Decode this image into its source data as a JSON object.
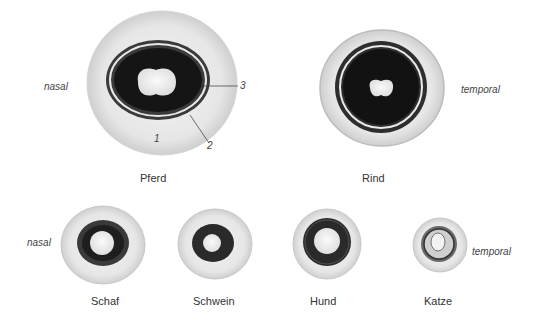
{
  "figure": {
    "orientation_labels": {
      "nasal_top": "nasal",
      "temporal_top": "temporal",
      "nasal_bottom": "nasal",
      "temporal_bottom": "temporal"
    },
    "specimens": [
      {
        "id": "pferd",
        "name": "Pferd"
      },
      {
        "id": "rind",
        "name": "Rind"
      },
      {
        "id": "schaf",
        "name": "Schaf"
      },
      {
        "id": "schwein",
        "name": "Schwein"
      },
      {
        "id": "hund",
        "name": "Hund"
      },
      {
        "id": "katze",
        "name": "Katze"
      }
    ],
    "annotations": [
      {
        "number": "1"
      },
      {
        "number": "2"
      },
      {
        "number": "3"
      }
    ]
  }
}
